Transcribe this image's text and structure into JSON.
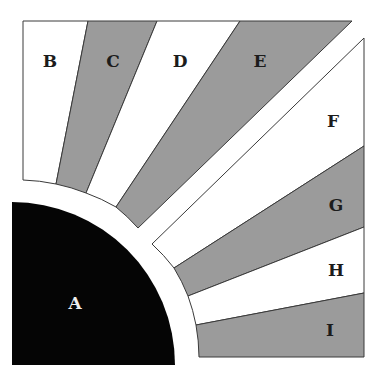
{
  "diagram": {
    "width": 370,
    "height": 372,
    "colors": {
      "background": "#ffffff",
      "band_white": "#ffffff",
      "band_gray": "#9b9b9b",
      "stroke": "#3a3a3a",
      "quarter_circle": "#050505",
      "label_dark": "#1c1c1c",
      "label_light": "#eeeeee"
    },
    "quarter_circle": {
      "id": "A",
      "label": "A",
      "center": [
        12,
        365
      ],
      "radius": 163,
      "label_pos": [
        75,
        303
      ]
    },
    "band_arc": {
      "center": [
        12,
        365
      ],
      "radius": 185
    },
    "regions": [
      {
        "id": "B",
        "label": "B",
        "fill": "white",
        "label_pos": [
          50,
          61
        ],
        "points": [
          [
            23,
            21
          ],
          [
            88,
            21
          ],
          [
            56,
            184
          ],
          [
            23,
            180
          ]
        ]
      },
      {
        "id": "C",
        "label": "C",
        "fill": "gray",
        "label_pos": [
          113,
          61
        ],
        "points": [
          [
            88,
            21
          ],
          [
            157,
            21
          ],
          [
            86,
            193
          ],
          [
            56,
            184
          ]
        ]
      },
      {
        "id": "D",
        "label": "D",
        "fill": "white",
        "label_pos": [
          180,
          61
        ],
        "points": [
          [
            157,
            21
          ],
          [
            240,
            21
          ],
          [
            116,
            207
          ],
          [
            86,
            193
          ]
        ]
      },
      {
        "id": "E",
        "label": "E",
        "fill": "gray",
        "label_pos": [
          260,
          61
        ],
        "points": [
          [
            240,
            21
          ],
          [
            352,
            21
          ],
          [
            138,
            228
          ],
          [
            116,
            207
          ]
        ]
      },
      {
        "id": "F",
        "label": "F",
        "fill": "white",
        "label_pos": [
          333,
          121
        ],
        "points": [
          [
            364,
            38
          ],
          [
            364,
            146
          ],
          [
            174,
            268
          ],
          [
            152,
            244
          ]
        ]
      },
      {
        "id": "G",
        "label": "G",
        "fill": "gray",
        "label_pos": [
          336,
          205
        ],
        "points": [
          [
            364,
            146
          ],
          [
            364,
            227
          ],
          [
            188,
            296
          ],
          [
            174,
            268
          ]
        ]
      },
      {
        "id": "H",
        "label": "H",
        "fill": "white",
        "label_pos": [
          336,
          270
        ],
        "points": [
          [
            364,
            227
          ],
          [
            364,
            293
          ],
          [
            196,
            325
          ],
          [
            188,
            296
          ]
        ]
      },
      {
        "id": "I",
        "label": "I",
        "fill": "gray",
        "label_pos": [
          330,
          330
        ],
        "points": [
          [
            364,
            293
          ],
          [
            364,
            357
          ],
          [
            199,
            357
          ],
          [
            196,
            325
          ]
        ]
      }
    ]
  }
}
